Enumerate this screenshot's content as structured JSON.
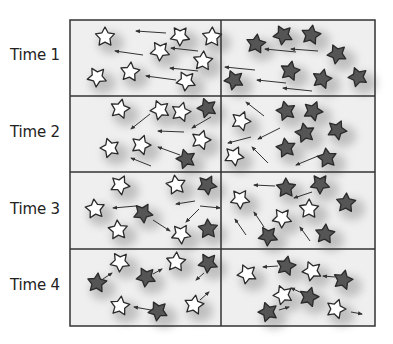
{
  "diagram": {
    "grid": {
      "left": 70,
      "top": 20,
      "right": 375,
      "bottom": 326,
      "mid_x": 221,
      "row_lines": [
        96,
        172,
        249
      ]
    },
    "colors": {
      "panel_bg": "#efefef",
      "border": "#333333",
      "white_star": "#ffffff",
      "dark_star": "#555555",
      "star_stroke": "#2a2a2a",
      "arrow": "#333333",
      "shadow": "#9a9a9a"
    },
    "legend": {
      "white_star": "white star",
      "dark_star": "dark star"
    },
    "rows": [
      {
        "label": "Time 1",
        "label_y": 56,
        "stars": [
          {
            "x": 105,
            "y": 37,
            "c": "w"
          },
          {
            "x": 180,
            "y": 36,
            "c": "w"
          },
          {
            "x": 212,
            "y": 37,
            "c": "w"
          },
          {
            "x": 160,
            "y": 51,
            "c": "w"
          },
          {
            "x": 203,
            "y": 61,
            "c": "w"
          },
          {
            "x": 97,
            "y": 77,
            "c": "w"
          },
          {
            "x": 130,
            "y": 72,
            "c": "w"
          },
          {
            "x": 186,
            "y": 81,
            "c": "w"
          },
          {
            "x": 256,
            "y": 44,
            "c": "d"
          },
          {
            "x": 283,
            "y": 35,
            "c": "d"
          },
          {
            "x": 311,
            "y": 35,
            "c": "d"
          },
          {
            "x": 337,
            "y": 54,
            "c": "d"
          },
          {
            "x": 290,
            "y": 71,
            "c": "d"
          },
          {
            "x": 234,
            "y": 80,
            "c": "d"
          },
          {
            "x": 322,
            "y": 79,
            "c": "d"
          },
          {
            "x": 358,
            "y": 77,
            "c": "d"
          }
        ],
        "arrows": [
          {
            "x1": 166,
            "y1": 33,
            "x2": 136,
            "y2": 31
          },
          {
            "x1": 143,
            "y1": 55,
            "x2": 115,
            "y2": 51
          },
          {
            "x1": 198,
            "y1": 51,
            "x2": 171,
            "y2": 48
          },
          {
            "x1": 198,
            "y1": 71,
            "x2": 170,
            "y2": 68
          },
          {
            "x1": 176,
            "y1": 80,
            "x2": 146,
            "y2": 76
          },
          {
            "x1": 296,
            "y1": 52,
            "x2": 265,
            "y2": 49
          },
          {
            "x1": 318,
            "y1": 51,
            "x2": 291,
            "y2": 49
          },
          {
            "x1": 255,
            "y1": 70,
            "x2": 225,
            "y2": 67
          },
          {
            "x1": 286,
            "y1": 83,
            "x2": 257,
            "y2": 80
          },
          {
            "x1": 312,
            "y1": 91,
            "x2": 283,
            "y2": 88
          }
        ]
      },
      {
        "label": "Time 2",
        "label_y": 133,
        "stars": [
          {
            "x": 120,
            "y": 109,
            "c": "w"
          },
          {
            "x": 160,
            "y": 110,
            "c": "w"
          },
          {
            "x": 181,
            "y": 112,
            "c": "w"
          },
          {
            "x": 207,
            "y": 108,
            "c": "d"
          },
          {
            "x": 201,
            "y": 140,
            "c": "w"
          },
          {
            "x": 110,
            "y": 148,
            "c": "w"
          },
          {
            "x": 141,
            "y": 145,
            "c": "w"
          },
          {
            "x": 186,
            "y": 159,
            "c": "d"
          },
          {
            "x": 241,
            "y": 121,
            "c": "w"
          },
          {
            "x": 286,
            "y": 111,
            "c": "d"
          },
          {
            "x": 313,
            "y": 111,
            "c": "d"
          },
          {
            "x": 305,
            "y": 133,
            "c": "d"
          },
          {
            "x": 337,
            "y": 130,
            "c": "d"
          },
          {
            "x": 286,
            "y": 148,
            "c": "d"
          },
          {
            "x": 234,
            "y": 156,
            "c": "w"
          },
          {
            "x": 327,
            "y": 158,
            "c": "d"
          }
        ],
        "arrows": [
          {
            "x1": 150,
            "y1": 114,
            "x2": 131,
            "y2": 129
          },
          {
            "x1": 211,
            "y1": 117,
            "x2": 192,
            "y2": 128
          },
          {
            "x1": 184,
            "y1": 132,
            "x2": 158,
            "y2": 131
          },
          {
            "x1": 180,
            "y1": 155,
            "x2": 158,
            "y2": 147
          },
          {
            "x1": 151,
            "y1": 166,
            "x2": 131,
            "y2": 158
          },
          {
            "x1": 264,
            "y1": 116,
            "x2": 246,
            "y2": 102
          },
          {
            "x1": 280,
            "y1": 128,
            "x2": 258,
            "y2": 139
          },
          {
            "x1": 251,
            "y1": 137,
            "x2": 228,
            "y2": 143
          },
          {
            "x1": 268,
            "y1": 163,
            "x2": 252,
            "y2": 147
          },
          {
            "x1": 318,
            "y1": 156,
            "x2": 296,
            "y2": 165
          }
        ]
      },
      {
        "label": "Time 3",
        "label_y": 210,
        "stars": [
          {
            "x": 120,
            "y": 185,
            "c": "w"
          },
          {
            "x": 176,
            "y": 185,
            "c": "w"
          },
          {
            "x": 207,
            "y": 185,
            "c": "d"
          },
          {
            "x": 95,
            "y": 209,
            "c": "w"
          },
          {
            "x": 143,
            "y": 213,
            "c": "d"
          },
          {
            "x": 118,
            "y": 230,
            "c": "w"
          },
          {
            "x": 181,
            "y": 234,
            "c": "w"
          },
          {
            "x": 208,
            "y": 229,
            "c": "d"
          },
          {
            "x": 240,
            "y": 199,
            "c": "w"
          },
          {
            "x": 286,
            "y": 188,
            "c": "d"
          },
          {
            "x": 320,
            "y": 184,
            "c": "d"
          },
          {
            "x": 309,
            "y": 209,
            "c": "w"
          },
          {
            "x": 282,
            "y": 218,
            "c": "w"
          },
          {
            "x": 346,
            "y": 203,
            "c": "d"
          },
          {
            "x": 268,
            "y": 236,
            "c": "d"
          },
          {
            "x": 325,
            "y": 234,
            "c": "d"
          }
        ],
        "arrows": [
          {
            "x1": 136,
            "y1": 206,
            "x2": 113,
            "y2": 208
          },
          {
            "x1": 153,
            "y1": 220,
            "x2": 170,
            "y2": 231
          },
          {
            "x1": 195,
            "y1": 201,
            "x2": 176,
            "y2": 204
          },
          {
            "x1": 200,
            "y1": 206,
            "x2": 220,
            "y2": 208
          },
          {
            "x1": 199,
            "y1": 209,
            "x2": 186,
            "y2": 222
          },
          {
            "x1": 275,
            "y1": 186,
            "x2": 254,
            "y2": 185
          },
          {
            "x1": 312,
            "y1": 192,
            "x2": 294,
            "y2": 198
          },
          {
            "x1": 246,
            "y1": 235,
            "x2": 235,
            "y2": 219
          },
          {
            "x1": 264,
            "y1": 227,
            "x2": 254,
            "y2": 212
          },
          {
            "x1": 310,
            "y1": 241,
            "x2": 300,
            "y2": 227
          }
        ]
      },
      {
        "label": "Time 4",
        "label_y": 286,
        "stars": [
          {
            "x": 120,
            "y": 262,
            "c": "w"
          },
          {
            "x": 176,
            "y": 262,
            "c": "w"
          },
          {
            "x": 208,
            "y": 263,
            "c": "d"
          },
          {
            "x": 97,
            "y": 283,
            "c": "d"
          },
          {
            "x": 146,
            "y": 277,
            "c": "d"
          },
          {
            "x": 120,
            "y": 306,
            "c": "w"
          },
          {
            "x": 158,
            "y": 311,
            "c": "d"
          },
          {
            "x": 194,
            "y": 305,
            "c": "w"
          },
          {
            "x": 247,
            "y": 274,
            "c": "w"
          },
          {
            "x": 286,
            "y": 266,
            "c": "d"
          },
          {
            "x": 312,
            "y": 271,
            "c": "w"
          },
          {
            "x": 343,
            "y": 280,
            "c": "d"
          },
          {
            "x": 283,
            "y": 295,
            "c": "w"
          },
          {
            "x": 309,
            "y": 297,
            "c": "d"
          },
          {
            "x": 268,
            "y": 312,
            "c": "d"
          },
          {
            "x": 336,
            "y": 309,
            "c": "w"
          }
        ],
        "arrows": [
          {
            "x1": 103,
            "y1": 279,
            "x2": 112,
            "y2": 273
          },
          {
            "x1": 153,
            "y1": 274,
            "x2": 162,
            "y2": 269
          },
          {
            "x1": 204,
            "y1": 273,
            "x2": 196,
            "y2": 280
          },
          {
            "x1": 151,
            "y1": 310,
            "x2": 134,
            "y2": 307
          },
          {
            "x1": 200,
            "y1": 300,
            "x2": 209,
            "y2": 292
          },
          {
            "x1": 278,
            "y1": 266,
            "x2": 263,
            "y2": 267
          },
          {
            "x1": 335,
            "y1": 277,
            "x2": 323,
            "y2": 276
          },
          {
            "x1": 302,
            "y1": 293,
            "x2": 291,
            "y2": 288
          },
          {
            "x1": 279,
            "y1": 310,
            "x2": 289,
            "y2": 307
          },
          {
            "x1": 351,
            "y1": 312,
            "x2": 362,
            "y2": 314
          }
        ]
      }
    ]
  }
}
